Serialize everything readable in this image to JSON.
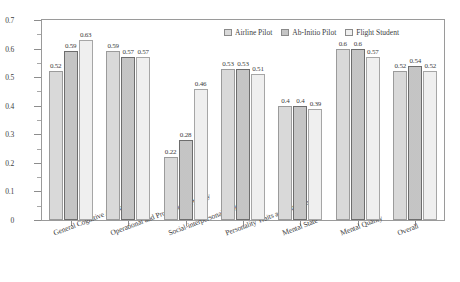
{
  "chart_data": {
    "type": "bar",
    "title": "",
    "xlabel": "",
    "ylabel": "",
    "ylim": [
      0,
      0.7
    ],
    "grid": false,
    "legend_position": "top-right",
    "ytick_labels": [
      "0",
      "0.1",
      "0.2",
      "0.3",
      "0.4",
      "0.5",
      "0.6",
      "0.7"
    ],
    "ytick_values": [
      0,
      0.1,
      0.2,
      0.3,
      0.4,
      0.5,
      0.6,
      0.7
    ],
    "yminor_values": [
      0.05,
      0.15,
      0.25,
      0.35,
      0.45,
      0.55,
      0.65
    ],
    "categories": [
      "General Cognitive Ability",
      "Operational and Professional Ability",
      "Social-interpersonal Ability",
      "Personality Traits and Attitude",
      "Mental State",
      "Mental Quality",
      "Overall"
    ],
    "series": [
      {
        "name": "Airline Pilot",
        "color": "#d9d9d9",
        "values": [
          0.52,
          0.59,
          0.22,
          0.53,
          0.4,
          0.6,
          0.52
        ],
        "labels": [
          "0.52",
          "0.59",
          "0.22",
          "0.53",
          "0.4",
          "0.6",
          "0.52"
        ]
      },
      {
        "name": "Ab-Initio Pilot",
        "color": "#8e8e8e",
        "values": [
          0.59,
          0.57,
          0.28,
          0.53,
          0.4,
          0.6,
          0.54
        ],
        "labels": [
          "0.59",
          "0.57",
          "0.28",
          "0.53",
          "0.4",
          "0.6",
          "0.54"
        ]
      },
      {
        "name": "Flight Student",
        "color": "#efefef",
        "values": [
          0.63,
          0.57,
          0.46,
          0.51,
          0.39,
          0.57,
          0.52
        ],
        "labels": [
          "0.63",
          "0.57",
          "0.46",
          "0.51",
          "0.39",
          "0.57",
          "0.52"
        ]
      }
    ]
  }
}
